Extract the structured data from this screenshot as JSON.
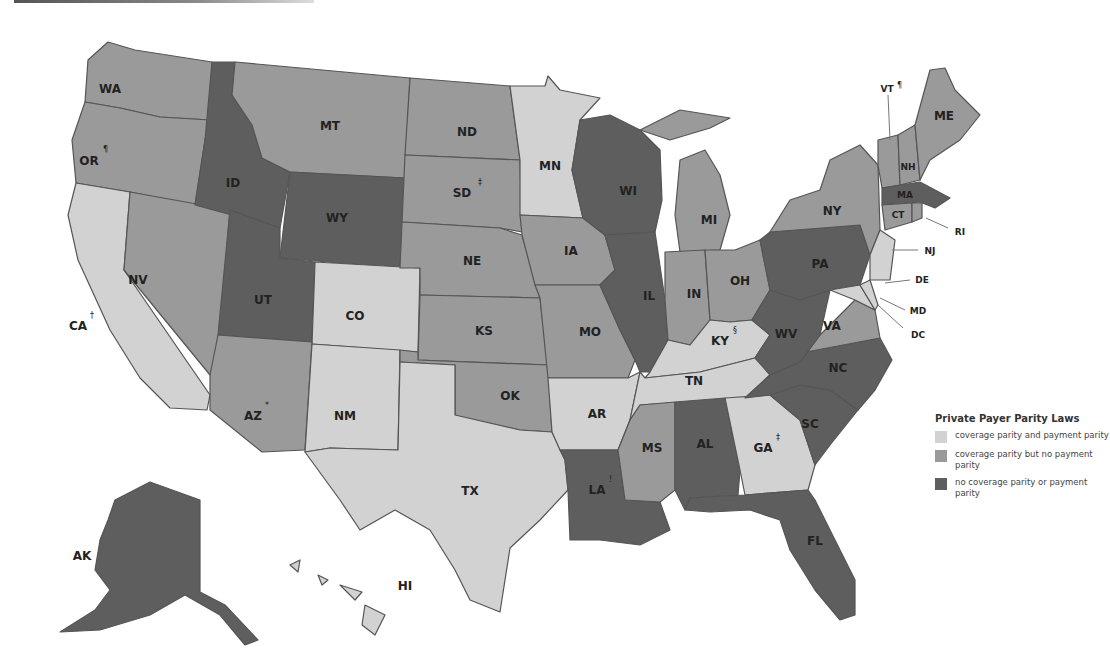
{
  "title": "Private Payer Parity Laws",
  "colors": {
    "coverage_and_payment": "#d2d2d2",
    "coverage_no_payment": "#9a9a9a",
    "none": "#5e5e5e"
  },
  "legend": {
    "title": "Private Payer Parity Laws",
    "items": [
      {
        "key": "light",
        "label": "coverage parity and payment parity"
      },
      {
        "key": "mid",
        "label": "coverage parity but no payment parity"
      },
      {
        "key": "dark",
        "label": "no coverage parity or payment parity"
      }
    ]
  },
  "states": {
    "WA": {
      "label": "WA",
      "category": "mid"
    },
    "OR": {
      "label": "OR",
      "mark": "¶",
      "category": "mid"
    },
    "CA": {
      "label": "CA",
      "mark": "†",
      "category": "light"
    },
    "NV": {
      "label": "NV",
      "category": "mid"
    },
    "ID": {
      "label": "ID",
      "category": "dark"
    },
    "MT": {
      "label": "MT",
      "category": "mid"
    },
    "WY": {
      "label": "WY",
      "category": "dark"
    },
    "UT": {
      "label": "UT",
      "category": "dark"
    },
    "AZ": {
      "label": "AZ",
      "mark": "*",
      "category": "mid"
    },
    "CO": {
      "label": "CO",
      "category": "light"
    },
    "NM": {
      "label": "NM",
      "category": "light"
    },
    "ND": {
      "label": "ND",
      "category": "mid"
    },
    "SD": {
      "label": "SD",
      "mark": "‡",
      "category": "mid"
    },
    "NE": {
      "label": "NE",
      "category": "mid"
    },
    "KS": {
      "label": "KS",
      "category": "mid"
    },
    "OK": {
      "label": "OK",
      "category": "mid"
    },
    "TX": {
      "label": "TX",
      "category": "light"
    },
    "MN": {
      "label": "MN",
      "category": "light"
    },
    "IA": {
      "label": "IA",
      "category": "mid"
    },
    "MO": {
      "label": "MO",
      "category": "mid"
    },
    "AR": {
      "label": "AR",
      "category": "light"
    },
    "LA": {
      "label": "LA",
      "mark": "!",
      "category": "dark"
    },
    "WI": {
      "label": "WI",
      "category": "dark"
    },
    "IL": {
      "label": "IL",
      "category": "dark"
    },
    "MI": {
      "label": "MI",
      "category": "mid"
    },
    "IN": {
      "label": "IN",
      "category": "mid"
    },
    "OH": {
      "label": "OH",
      "category": "mid"
    },
    "KY": {
      "label": "KY",
      "mark": "§",
      "category": "light"
    },
    "TN": {
      "label": "TN",
      "category": "light"
    },
    "MS": {
      "label": "MS",
      "category": "mid"
    },
    "AL": {
      "label": "AL",
      "category": "dark"
    },
    "GA": {
      "label": "GA",
      "mark": "‡",
      "category": "light"
    },
    "FL": {
      "label": "FL",
      "category": "dark"
    },
    "SC": {
      "label": "SC",
      "category": "dark"
    },
    "NC": {
      "label": "NC",
      "category": "dark"
    },
    "VA": {
      "label": "VA",
      "category": "mid"
    },
    "WV": {
      "label": "WV",
      "category": "dark"
    },
    "PA": {
      "label": "PA",
      "category": "dark"
    },
    "NY": {
      "label": "NY",
      "category": "mid"
    },
    "VT": {
      "label": "VT",
      "mark": "¶",
      "category": "mid"
    },
    "NH": {
      "label": "NH",
      "category": "mid"
    },
    "ME": {
      "label": "ME",
      "category": "mid"
    },
    "MA": {
      "label": "MA",
      "category": "dark"
    },
    "CT": {
      "label": "CT",
      "category": "mid"
    },
    "RI": {
      "label": "RI",
      "category": "mid"
    },
    "NJ": {
      "label": "NJ",
      "category": "light"
    },
    "DE": {
      "label": "DE",
      "category": "light"
    },
    "MD": {
      "label": "MD",
      "category": "light"
    },
    "DC": {
      "label": "DC",
      "category": "light"
    },
    "AK": {
      "label": "AK",
      "category": "dark"
    },
    "HI": {
      "label": "HI",
      "category": "light"
    }
  }
}
